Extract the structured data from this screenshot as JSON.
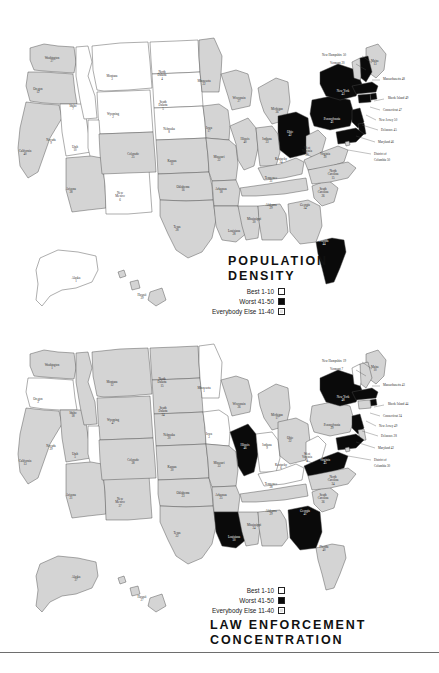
{
  "page": {
    "kind": "two-choropleth-maps-us-states",
    "background": "#ffffff",
    "divider_color": "#6e6e6e"
  },
  "legend_common": {
    "rows": [
      {
        "label": "Best  1-10",
        "swatch": "white"
      },
      {
        "label": "Worst 41-50",
        "swatch": "black"
      },
      {
        "label": "Everybody Else 11-40",
        "swatch": "gray"
      }
    ]
  },
  "colors": {
    "best": "#ffffff",
    "worst": "#0a0a0a",
    "middle": "#d4d4d4",
    "border": "#4a4a4a",
    "text": "#2b2b2b"
  },
  "maps": [
    {
      "id": "population-density",
      "title_line1": "POPULATION",
      "title_line2": "DENSITY",
      "states": [
        {
          "name": "Washington",
          "value": 27,
          "class": "middle",
          "x": 52,
          "y": 59
        },
        {
          "name": "Oregon",
          "value": 12,
          "class": "middle",
          "x": 38,
          "y": 90
        },
        {
          "name": "California",
          "value": 40,
          "class": "middle",
          "x": 25,
          "y": 152
        },
        {
          "name": "Nevada",
          "value": 9,
          "class": "best",
          "x": 51,
          "y": 141
        },
        {
          "name": "Idaho",
          "value": 7,
          "class": "best",
          "x": 73,
          "y": 107
        },
        {
          "name": "Montana",
          "value": 3,
          "class": "best",
          "x": 112,
          "y": 77
        },
        {
          "name": "Wyoming",
          "value": 2,
          "class": "best",
          "x": 113,
          "y": 115
        },
        {
          "name": "Utah",
          "value": 10,
          "class": "best",
          "x": 75,
          "y": 148
        },
        {
          "name": "Arizona",
          "value": 38,
          "class": "middle",
          "x": 71,
          "y": 190
        },
        {
          "name": "New Mexico",
          "value": 6,
          "class": "best",
          "x": 120,
          "y": 194
        },
        {
          "name": "Colorado",
          "value": 25,
          "class": "middle",
          "x": 133,
          "y": 155
        },
        {
          "name": "North Dakota",
          "value": 4,
          "class": "best",
          "x": 162,
          "y": 73
        },
        {
          "name": "South Dakota",
          "value": 5,
          "class": "best",
          "x": 163,
          "y": 103
        },
        {
          "name": "Nebraska",
          "value": 8,
          "class": "best",
          "x": 169,
          "y": 130
        },
        {
          "name": "Kansas",
          "value": 11,
          "class": "middle",
          "x": 172,
          "y": 162
        },
        {
          "name": "Oklahoma",
          "value": 16,
          "class": "middle",
          "x": 183,
          "y": 188
        },
        {
          "name": "Texas",
          "value": 28,
          "class": "middle",
          "x": 177,
          "y": 228
        },
        {
          "name": "Minnesota",
          "value": 22,
          "class": "middle",
          "x": 204,
          "y": 82
        },
        {
          "name": "Iowa",
          "value": 17,
          "class": "middle",
          "x": 209,
          "y": 129
        },
        {
          "name": "Missouri",
          "value": 22,
          "class": "middle",
          "x": 219,
          "y": 158
        },
        {
          "name": "Arkansas",
          "value": 18,
          "class": "middle",
          "x": 221,
          "y": 190
        },
        {
          "name": "Louisiana",
          "value": 28,
          "class": "middle",
          "x": 234,
          "y": 232
        },
        {
          "name": "Wisconsin",
          "value": 27,
          "class": "middle",
          "x": 239,
          "y": 99
        },
        {
          "name": "Illinois",
          "value": 40,
          "class": "middle",
          "x": 245,
          "y": 140
        },
        {
          "name": "Mississippi",
          "value": 30,
          "class": "middle",
          "x": 254,
          "y": 220
        },
        {
          "name": "Michigan",
          "value": 36,
          "class": "middle",
          "x": 277,
          "y": 110
        },
        {
          "name": "Indiana",
          "value": 33,
          "class": "middle",
          "x": 267,
          "y": 140
        },
        {
          "name": "Kentucky",
          "value": 34,
          "class": "middle",
          "x": 281,
          "y": 160
        },
        {
          "name": "Tennessee",
          "value": 31,
          "class": "middle",
          "x": 271,
          "y": 179
        },
        {
          "name": "Alabama",
          "value": 29,
          "class": "middle",
          "x": 271,
          "y": 206
        },
        {
          "name": "Ohio",
          "value": 42,
          "class": "worst",
          "x": 290,
          "y": 133
        },
        {
          "name": "West Virginia",
          "value": 20,
          "class": "middle",
          "x": 307,
          "y": 149
        },
        {
          "name": "Virginia",
          "value": 30,
          "class": "middle",
          "x": 325,
          "y": 155
        },
        {
          "name": "Georgia",
          "value": 34,
          "class": "middle",
          "x": 305,
          "y": 206
        },
        {
          "name": "South Carolina",
          "value": 26,
          "class": "middle",
          "x": 323,
          "y": 190
        },
        {
          "name": "North Carolina",
          "value": 15,
          "class": "middle",
          "x": 333,
          "y": 172
        },
        {
          "name": "Florida",
          "value": 44,
          "class": "worst",
          "x": 324,
          "y": 242
        },
        {
          "name": "Pennsylvania",
          "value": 41,
          "class": "worst",
          "x": 332,
          "y": 120
        },
        {
          "name": "New York",
          "value": 43,
          "class": "worst",
          "x": 343,
          "y": 92
        },
        {
          "name": "Maine",
          "value": 13,
          "class": "middle",
          "x": 375,
          "y": 62
        },
        {
          "name": "Alaska",
          "value": 1,
          "class": "best",
          "x": 76,
          "y": 279
        },
        {
          "name": "Hawaii",
          "value": 39,
          "class": "middle",
          "x": 142,
          "y": 296
        }
      ],
      "callouts": [
        {
          "name": "New Hampshire",
          "value": 50,
          "x": 322,
          "y": 56,
          "lx1": 362,
          "ly1": 56,
          "lx2": 372,
          "ly2": 63
        },
        {
          "name": "Vermont",
          "value": 20,
          "x": 330,
          "y": 64,
          "lx1": 356,
          "ly1": 64,
          "lx2": 366,
          "ly2": 70
        },
        {
          "name": "Massachusetts",
          "value": 48,
          "x": 383,
          "y": 80,
          "lx1": 372,
          "ly1": 80,
          "lx2": 380,
          "ly2": 80
        },
        {
          "name": "Rhode Island",
          "value": 49,
          "x": 388,
          "y": 99,
          "lx1": 374,
          "ly1": 101,
          "lx2": 384,
          "ly2": 99
        },
        {
          "name": "Connecticut",
          "value": 47,
          "x": 383,
          "y": 111,
          "lx1": 370,
          "ly1": 107,
          "lx2": 380,
          "ly2": 110
        },
        {
          "name": "New Jersey",
          "value": 50,
          "x": 379,
          "y": 121,
          "lx1": 366,
          "ly1": 115,
          "lx2": 376,
          "ly2": 120
        },
        {
          "name": "Delaware",
          "value": 45,
          "x": 381,
          "y": 131,
          "lx1": 362,
          "ly1": 125,
          "lx2": 378,
          "ly2": 130
        },
        {
          "name": "Maryland",
          "value": 46,
          "x": 378,
          "y": 143,
          "lx1": 356,
          "ly1": 136,
          "lx2": 375,
          "ly2": 142
        },
        {
          "name": "District of",
          "value": null,
          "x": 374,
          "y": 155,
          "lx1": 348,
          "ly1": 150,
          "lx2": 371,
          "ly2": 154
        },
        {
          "name": "Columbia",
          "value": 50,
          "x": 374,
          "y": 161,
          "lx1": null,
          "ly1": null,
          "lx2": null,
          "ly2": null
        }
      ],
      "legend_position": "right-below-title"
    },
    {
      "id": "law-enforcement-concentration",
      "title_line1": "LAW ENFORCEMENT",
      "title_line2": "CONCENTRATION",
      "states": [
        {
          "name": "Washington",
          "value": 1,
          "class": "middle",
          "x": 52,
          "y": 366
        },
        {
          "name": "Oregon",
          "value": 3,
          "class": "best",
          "x": 38,
          "y": 400
        },
        {
          "name": "California",
          "value": 13,
          "class": "middle",
          "x": 25,
          "y": 462
        },
        {
          "name": "Nevada",
          "value": 39,
          "class": "middle",
          "x": 51,
          "y": 447
        },
        {
          "name": "Idaho",
          "value": 18,
          "class": "middle",
          "x": 73,
          "y": 414
        },
        {
          "name": "Montana",
          "value": 12,
          "class": "middle",
          "x": 112,
          "y": 383
        },
        {
          "name": "Wyoming",
          "value": 47,
          "class": "middle",
          "x": 113,
          "y": 421
        },
        {
          "name": "Utah",
          "value": 5,
          "class": "best",
          "x": 75,
          "y": 455
        },
        {
          "name": "Arizona",
          "value": 21,
          "class": "middle",
          "x": 71,
          "y": 496
        },
        {
          "name": "New Mexico",
          "value": 37,
          "class": "middle",
          "x": 120,
          "y": 500
        },
        {
          "name": "Colorado",
          "value": 38,
          "class": "middle",
          "x": 133,
          "y": 461
        },
        {
          "name": "North Dakota",
          "value": 15,
          "class": "middle",
          "x": 162,
          "y": 380
        },
        {
          "name": "South Dakota",
          "value": 34,
          "class": "middle",
          "x": 163,
          "y": 409
        },
        {
          "name": "Nebraska",
          "value": 20,
          "class": "middle",
          "x": 169,
          "y": 436
        },
        {
          "name": "Kansas",
          "value": 30,
          "class": "middle",
          "x": 172,
          "y": 468
        },
        {
          "name": "Oklahoma",
          "value": 23,
          "class": "middle",
          "x": 183,
          "y": 494
        },
        {
          "name": "Texas",
          "value": 22,
          "class": "middle",
          "x": 177,
          "y": 534
        },
        {
          "name": "Minnesota",
          "value": 1,
          "class": "best",
          "x": 204,
          "y": 389
        },
        {
          "name": "Iowa",
          "value": 3,
          "class": "best",
          "x": 209,
          "y": 435
        },
        {
          "name": "Missouri",
          "value": 33,
          "class": "middle",
          "x": 219,
          "y": 464
        },
        {
          "name": "Arkansas",
          "value": 25,
          "class": "middle",
          "x": 221,
          "y": 496
        },
        {
          "name": "Louisiana",
          "value": 50,
          "class": "worst",
          "x": 234,
          "y": 538
        },
        {
          "name": "Wisconsin",
          "value": 26,
          "class": "middle",
          "x": 239,
          "y": 405
        },
        {
          "name": "Illinois",
          "value": 46,
          "class": "worst",
          "x": 245,
          "y": 446
        },
        {
          "name": "Mississippi",
          "value": 24,
          "class": "middle",
          "x": 254,
          "y": 526
        },
        {
          "name": "Michigan",
          "value": 17,
          "class": "middle",
          "x": 277,
          "y": 416
        },
        {
          "name": "Indiana",
          "value": 9,
          "class": "best",
          "x": 267,
          "y": 446
        },
        {
          "name": "Kentucky",
          "value": 6,
          "class": "best",
          "x": 281,
          "y": 466
        },
        {
          "name": "Tennessee",
          "value": 38,
          "class": "middle",
          "x": 271,
          "y": 485
        },
        {
          "name": "Alabama",
          "value": 29,
          "class": "middle",
          "x": 271,
          "y": 512
        },
        {
          "name": "Ohio",
          "value": 22,
          "class": "middle",
          "x": 290,
          "y": 439
        },
        {
          "name": "West Virginia",
          "value": 4,
          "class": "best",
          "x": 307,
          "y": 455
        },
        {
          "name": "Virginia",
          "value": 45,
          "class": "worst",
          "x": 325,
          "y": 461
        },
        {
          "name": "Georgia",
          "value": 41,
          "class": "worst",
          "x": 305,
          "y": 512
        },
        {
          "name": "South Carolina",
          "value": 36,
          "class": "middle",
          "x": 323,
          "y": 496
        },
        {
          "name": "North Carolina",
          "value": 34,
          "class": "middle",
          "x": 333,
          "y": 478
        },
        {
          "name": "Florida",
          "value": 40,
          "class": "middle",
          "x": 324,
          "y": 548
        },
        {
          "name": "Pennsylvania",
          "value": 29,
          "class": "middle",
          "x": 332,
          "y": 426
        },
        {
          "name": "New York",
          "value": 48,
          "class": "worst",
          "x": 343,
          "y": 398
        },
        {
          "name": "Maine",
          "value": 10,
          "class": "middle",
          "x": 375,
          "y": 368
        },
        {
          "name": "Alaska",
          "value": 37,
          "class": "middle",
          "x": 76,
          "y": 578
        },
        {
          "name": "Hawaii",
          "value": 27,
          "class": "middle",
          "x": 142,
          "y": 598
        }
      ],
      "callouts": [
        {
          "name": "New Hampshire",
          "value": 19,
          "x": 322,
          "y": 362,
          "lx1": 362,
          "ly1": 362,
          "lx2": 372,
          "ly2": 369
        },
        {
          "name": "Vermont",
          "value": 7,
          "x": 330,
          "y": 370,
          "lx1": 356,
          "ly1": 370,
          "lx2": 366,
          "ly2": 376
        },
        {
          "name": "Massachusetts",
          "value": 43,
          "x": 383,
          "y": 386,
          "lx1": 372,
          "ly1": 386,
          "lx2": 380,
          "ly2": 386
        },
        {
          "name": "Rhode Island",
          "value": 44,
          "x": 388,
          "y": 405,
          "lx1": 374,
          "ly1": 407,
          "lx2": 384,
          "ly2": 405
        },
        {
          "name": "Connecticut",
          "value": 24,
          "x": 383,
          "y": 417,
          "lx1": 370,
          "ly1": 413,
          "lx2": 380,
          "ly2": 416
        },
        {
          "name": "New Jersey",
          "value": 49,
          "x": 379,
          "y": 427,
          "lx1": 366,
          "ly1": 421,
          "lx2": 376,
          "ly2": 426
        },
        {
          "name": "Delaware",
          "value": 28,
          "x": 381,
          "y": 437,
          "lx1": 362,
          "ly1": 431,
          "lx2": 378,
          "ly2": 436
        },
        {
          "name": "Maryland",
          "value": 42,
          "x": 378,
          "y": 449,
          "lx1": 356,
          "ly1": 442,
          "lx2": 375,
          "ly2": 448
        },
        {
          "name": "District of",
          "value": null,
          "x": 374,
          "y": 461,
          "lx1": 348,
          "ly1": 456,
          "lx2": 371,
          "ly2": 460
        },
        {
          "name": "Columbia",
          "value": 30,
          "x": 374,
          "y": 467,
          "lx1": null,
          "ly1": null,
          "lx2": null,
          "ly2": null
        }
      ],
      "legend_position": "right-above-title"
    }
  ]
}
